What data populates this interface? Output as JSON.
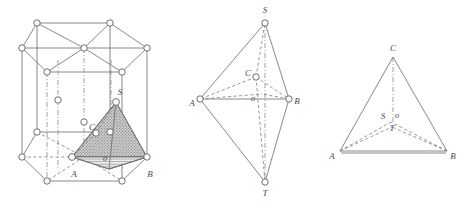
{
  "figure": {
    "accent_color": "#6b6b6b",
    "background_color": "#ffffff",
    "panels": [
      {
        "id": "panel-hexagonal-prism",
        "name": "hexagonal-close-packed-cell",
        "description": "Hexagonal prism unit cell with inscribed shaded tetrahedron",
        "labels": [
          {
            "key": "A",
            "text": "A",
            "x": 74,
            "y": 177
          },
          {
            "key": "B",
            "text": "B",
            "x": 148,
            "y": 177
          },
          {
            "key": "S",
            "text": "S",
            "x": 119,
            "y": 93
          },
          {
            "key": "C",
            "text": "C",
            "x": 93,
            "y": 129
          },
          {
            "key": "sigma",
            "text": "σ",
            "x": 104,
            "y": 159
          }
        ]
      },
      {
        "id": "panel-bipyramid",
        "name": "trigonal-bipyramid",
        "description": "Trigonal bipyramid with apices S and T",
        "labels": [
          {
            "key": "S",
            "text": "S",
            "x": 264,
            "y": 11
          },
          {
            "key": "T",
            "text": "T",
            "x": 264,
            "y": 200
          },
          {
            "key": "A",
            "text": "A",
            "x": 194,
            "y": 102
          },
          {
            "key": "B",
            "text": "B",
            "x": 295,
            "y": 102
          },
          {
            "key": "C",
            "text": "C",
            "x": 235,
            "y": 81
          },
          {
            "key": "sigma",
            "text": "σ",
            "x": 250,
            "y": 102
          }
        ]
      },
      {
        "id": "panel-tetrahedron",
        "name": "tetrahedron",
        "description": "Tetrahedron ABC with interior points S and T",
        "labels": [
          {
            "key": "C",
            "text": "C",
            "x": 390,
            "y": 50
          },
          {
            "key": "A",
            "text": "A",
            "x": 331,
            "y": 157
          },
          {
            "key": "B",
            "text": "B",
            "x": 450,
            "y": 157
          },
          {
            "key": "S",
            "text": "S",
            "x": 381,
            "y": 117
          },
          {
            "key": "T",
            "text": "T",
            "x": 390,
            "y": 128
          },
          {
            "key": "sigma",
            "text": "σ",
            "x": 394,
            "y": 116
          }
        ]
      }
    ]
  }
}
